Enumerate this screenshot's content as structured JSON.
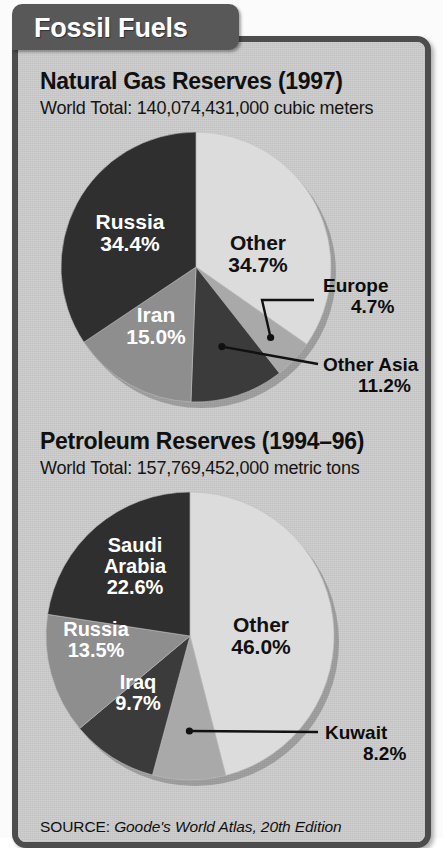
{
  "header": {
    "tab_label": "Fossil Fuels"
  },
  "source": {
    "prefix": "SOURCE:",
    "citation": "Goode's World Atlas, 20th Edition"
  },
  "colors": {
    "panel_bg": "#cdcdcd",
    "panel_border": "#4d4d4d",
    "tab_bg": "#585858",
    "slice_darkest": "#2f2f2f",
    "slice_dark": "#3b3b3b",
    "slice_mid": "#8e8e8e",
    "slice_midlight": "#a9a9a9",
    "slice_light": "#dcdcdc"
  },
  "sections": [
    {
      "title": "Natural Gas Reserves (1997)",
      "subtitle": "World Total: 140,074,431,000 cubic meters"
    },
    {
      "title": "Petroleum Reserves (1994–96)",
      "subtitle": "World Total: 157,769,452,000 metric tons"
    }
  ],
  "chart_data": [
    {
      "type": "pie",
      "title": "Natural Gas Reserves (1997)",
      "subtitle": "World Total: 140,074,431,000 cubic meters",
      "unit": "cubic meters",
      "world_total": "140,074,431,000",
      "year": "1997",
      "start_angle_deg": 0,
      "direction": "clockwise",
      "legend": "none",
      "labels": [
        "Other",
        "Europe",
        "Other Asia",
        "Iran",
        "Russia"
      ],
      "values": [
        34.7,
        4.7,
        11.2,
        15.0,
        34.4
      ],
      "value_text": [
        "34.7%",
        "4.7%",
        "11.2%",
        "15.0%",
        "34.4%"
      ],
      "colors": [
        "#dcdcdc",
        "#a9a9a9",
        "#3b3b3b",
        "#8e8e8e",
        "#2f2f2f"
      ],
      "label_placement": [
        "inside",
        "callout",
        "callout",
        "inside",
        "inside"
      ],
      "label_text_color": [
        "dark",
        "dark",
        "dark",
        "light",
        "light"
      ]
    },
    {
      "type": "pie",
      "title": "Petroleum Reserves (1994–96)",
      "subtitle": "World Total: 157,769,452,000 metric tons",
      "unit": "metric tons",
      "world_total": "157,769,452,000",
      "year": "1994–96",
      "start_angle_deg": 0,
      "direction": "clockwise",
      "legend": "none",
      "labels": [
        "Other",
        "Kuwait",
        "Iraq",
        "Russia",
        "Saudi Arabia"
      ],
      "values": [
        46.0,
        8.2,
        9.7,
        13.5,
        22.6
      ],
      "value_text": [
        "46.0%",
        "8.2%",
        "9.7%",
        "13.5%",
        "22.6%"
      ],
      "colors": [
        "#dcdcdc",
        "#a9a9a9",
        "#3b3b3b",
        "#8e8e8e",
        "#2f2f2f"
      ],
      "label_placement": [
        "inside",
        "callout",
        "inside",
        "inside",
        "inside"
      ],
      "label_text_color": [
        "dark",
        "dark",
        "light",
        "light",
        "light"
      ]
    }
  ]
}
